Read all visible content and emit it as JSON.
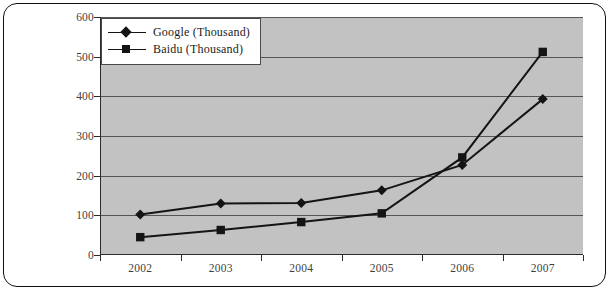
{
  "chart_data": {
    "type": "line",
    "title": "",
    "xlabel": "",
    "ylabel": "",
    "categories": [
      "2002",
      "2003",
      "2004",
      "2005",
      "2006",
      "2007"
    ],
    "ylim": [
      0,
      600
    ],
    "ytick_labels": [
      "0",
      "100",
      "200",
      "300",
      "400",
      "500",
      "600"
    ],
    "ytick_values": [
      0,
      100,
      200,
      300,
      400,
      500,
      600
    ],
    "grid": true,
    "legend_position": "top-left",
    "plot_background": "#c2c2c2",
    "series": [
      {
        "name": "Google (Thousand)",
        "marker": "diamond",
        "color": "#141414",
        "values": [
          102,
          130,
          131,
          163,
          227,
          393
        ]
      },
      {
        "name": "Baidu (Thousand)",
        "marker": "square",
        "color": "#141414",
        "values": [
          45,
          63,
          83,
          105,
          246,
          512
        ]
      }
    ]
  },
  "legend": {
    "items": [
      {
        "label": "Google (Thousand)",
        "marker": "diamond-marker"
      },
      {
        "label": "Baidu (Thousand)",
        "marker": "square-marker"
      }
    ]
  }
}
